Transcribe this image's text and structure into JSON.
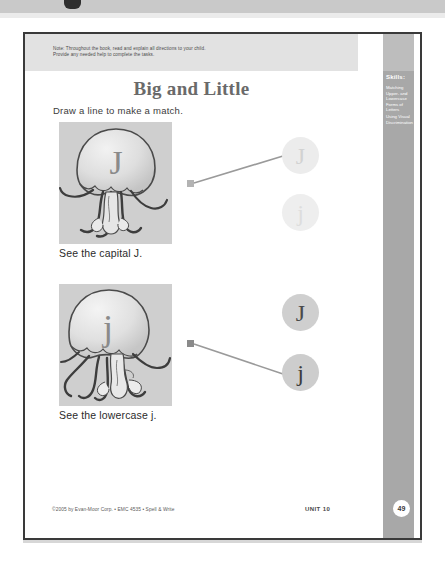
{
  "window": {
    "chrome_visible": true
  },
  "page": {
    "note": "Note: Throughout the book, read and explain all directions to your child.\nProvide any needed help to complete the tasks.",
    "title": "Big and Little",
    "instruction": "Draw a line to make a match.",
    "skills_heading": "Skills:",
    "skills": [
      "Matching\nUpper- and\nLowercase\nForms of\nLetters",
      "Using Visual\nDiscrimination"
    ],
    "problems": [
      {
        "art_letter": "J",
        "art_name": "jellyfish-capital-j",
        "caption": "See the capital J.",
        "choices": [
          {
            "label": "J",
            "selected": true
          },
          {
            "label": "j",
            "selected": false
          }
        ]
      },
      {
        "art_letter": "j",
        "art_name": "jellyfish-lowercase-j",
        "caption": "See the lowercase j.",
        "choices": [
          {
            "label": "J",
            "selected": false
          },
          {
            "label": "j",
            "selected": true
          }
        ]
      }
    ],
    "footer": {
      "copyright": "©2005 by Evan-Moor Corp. • EMC 4535 • Spell & Write",
      "unit": "UNIT 10",
      "page_number": "49"
    }
  },
  "colors": {
    "sheet_border": "#3a3a3a",
    "note_band": "#e2e2e2",
    "skills_band": "#a8a8a8",
    "skills_band_top": "#bdbdbd",
    "title_text": "#6a6a6a",
    "art_background": "#cfcfcf",
    "choice_faint": "#ececec",
    "choice_strong": "#cdcdcd",
    "connector": "#9a9a9a"
  }
}
